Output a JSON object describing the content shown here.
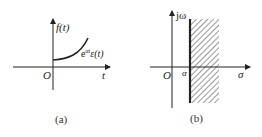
{
  "figure_a": {
    "caption": "(a)",
    "y_axis_label": "f(t)",
    "x_axis_label": "t",
    "origin_label": "O",
    "curve_label_base": "e",
    "curve_label_sup": "αt",
    "curve_label_rest": "ε(t)"
  },
  "figure_b": {
    "caption": "(b)",
    "y_axis_label": "jω",
    "x_axis_label": "σ",
    "origin_label": "O",
    "abscissa_label": "α"
  },
  "colors": {
    "ink": "#222222",
    "background": "#ffffff"
  }
}
